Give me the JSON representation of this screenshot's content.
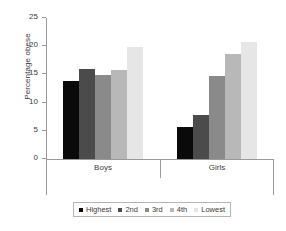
{
  "chart_data": {
    "type": "bar",
    "title": "",
    "xlabel": "",
    "ylabel": "Percentage obese",
    "categories": [
      "Boys",
      "Girls"
    ],
    "ylim": [
      0,
      25
    ],
    "yticks": [
      0,
      5,
      10,
      15,
      20,
      25
    ],
    "ytick_labels": [
      "0",
      "5",
      "10",
      "15",
      "20",
      "25"
    ],
    "grid": false,
    "legend_position": "bottom",
    "series": [
      {
        "name": "Highest",
        "color": "#0a0a0a",
        "values": [
          13.9,
          5.7
        ]
      },
      {
        "name": "2nd",
        "color": "#4b4b4b",
        "values": [
          15.9,
          7.8
        ]
      },
      {
        "name": "3rd",
        "color": "#8a8a8a",
        "values": [
          14.9,
          14.8
        ]
      },
      {
        "name": "4th",
        "color": "#b8b8b8",
        "values": [
          15.8,
          18.7
        ]
      },
      {
        "name": "Lowest",
        "color": "#e6e6e6",
        "values": [
          19.8,
          20.7
        ]
      }
    ]
  }
}
